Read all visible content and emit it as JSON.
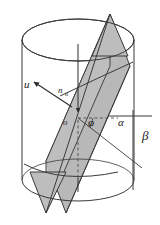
{
  "figure": {
    "canvas": {
      "width": 160,
      "height": 225,
      "background": "#ffffff"
    },
    "colors": {
      "stroke": "#3b3b3b",
      "plane_fill": "#b8b8b8",
      "plane_fill_light": "#c6c6c6",
      "label": "#1a1a1a",
      "dash": "#4a4a4a"
    },
    "labels": {
      "vector_u": "u",
      "normal_n": "n",
      "normal_n_subscript": "u",
      "origin": "o",
      "angle_phi": "φ",
      "angle_alpha": "α",
      "angle_beta": "β"
    },
    "geometry": {
      "cylinder": {
        "center_x": 78,
        "top_ellipse_cy": 40,
        "bottom_ellipse_cy": 180,
        "rx": 56,
        "ry": 21
      },
      "plane": {
        "apex_top": {
          "x": 110,
          "y": 14
        },
        "apex_bottom": {
          "x": 46,
          "y": 213
        }
      },
      "origin_point": {
        "x": 78,
        "y": 118
      },
      "vector_u_tip": {
        "x": 34,
        "y": 82
      },
      "vector_u_tail": {
        "x": 72,
        "y": 107
      }
    }
  }
}
